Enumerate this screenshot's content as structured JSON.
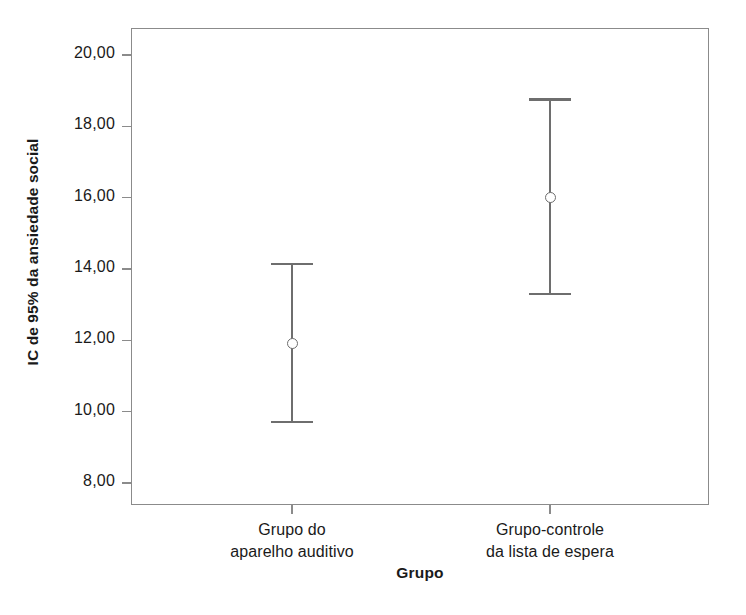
{
  "chart_data": {
    "type": "scatter",
    "title": "",
    "subtitle": "",
    "xlabel": "Grupo",
    "ylabel": "IC de 95% da ansiedade social",
    "categories": [
      "Grupo do aparelho auditivo",
      "Grupo-controle da lista de espera"
    ],
    "category_lines": [
      [
        "Grupo do",
        "aparelho auditivo"
      ],
      [
        "Grupo-controle",
        "da lista de espera"
      ]
    ],
    "series": [
      {
        "name": "IC de 95% da ansiedade social",
        "values": [
          11.9,
          16.0
        ],
        "ci_lower": [
          9.7,
          13.3
        ],
        "ci_upper": [
          14.15,
          18.75
        ]
      }
    ],
    "ylim": [
      8.0,
      20.0
    ],
    "ytick_values": [
      20.0,
      18.0,
      16.0,
      14.0,
      12.0,
      10.0,
      8.0
    ],
    "ytick_labels": [
      "20,00",
      "18,00",
      "16,00",
      "14,00",
      "12,00",
      "10,00",
      "8,00"
    ],
    "grid": false,
    "legend": false,
    "legend_position": "none",
    "marker": "open-circle",
    "error_bar_style": "capped",
    "decimal_separator": ",",
    "colors": {
      "background": "#ffffff",
      "frame": "#8b8b8b",
      "errorbar": "#6e6e6e",
      "text": "#1a1a1a"
    }
  }
}
